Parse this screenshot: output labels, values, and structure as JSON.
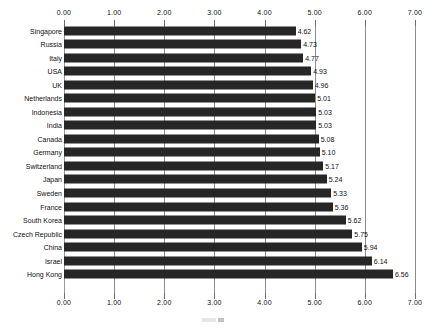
{
  "chart_data": {
    "type": "bar",
    "orientation": "horizontal",
    "title": "",
    "subtitle": "",
    "xlabel": "",
    "ylabel": "",
    "xlim": [
      0.0,
      7.0
    ],
    "xticks": [
      "0.00",
      "1.00",
      "2.00",
      "3.00",
      "4.00",
      "5.00",
      "6.00",
      "7.00"
    ],
    "xtick_values": [
      0,
      1,
      2,
      3,
      4,
      5,
      6,
      7
    ],
    "grid": true,
    "grid_axis": "x",
    "legend": false,
    "legend_position": "none",
    "axis_top": true,
    "axis_bottom": true,
    "bar_color": "#262626",
    "gridline_color": "#8c8c8c",
    "background_color": "#ffffff",
    "categories": [
      "Singapore",
      "Russia",
      "Italy",
      "USA",
      "UK",
      "Netherlands",
      "Indonesia",
      "India",
      "Canada",
      "Germany",
      "Switzerland",
      "Japan",
      "Sweden",
      "France",
      "South Korea",
      "Czech Republic",
      "China",
      "Israel",
      "Hong Kong"
    ],
    "values": [
      4.62,
      4.73,
      4.77,
      4.93,
      4.96,
      5.01,
      5.03,
      5.03,
      5.08,
      5.1,
      5.17,
      5.24,
      5.33,
      5.36,
      5.62,
      5.75,
      5.94,
      6.14,
      6.56
    ],
    "value_labels": [
      "4.62",
      "4.73",
      "4.77",
      "4.93",
      "4.96",
      "5.01",
      "5.03",
      "5.03",
      "5.08",
      "5.10",
      "5.17",
      "5.24",
      "5.33",
      "5.36",
      "5.62",
      "5.75",
      "5.94",
      "6.14",
      "6.56"
    ]
  }
}
